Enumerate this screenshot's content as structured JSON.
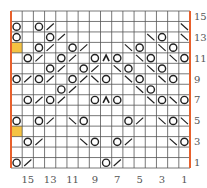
{
  "chart": {
    "columns": 16,
    "rows": 15,
    "colors": {
      "grid": "#555555",
      "border": "#e8602c",
      "highlight": "#f5c242",
      "symbol": "#222222",
      "label": "#555555"
    },
    "column_labels": [
      {
        "col": 15,
        "text": "15"
      },
      {
        "col": 13,
        "text": "13"
      },
      {
        "col": 11,
        "text": "11"
      },
      {
        "col": 9,
        "text": "9"
      },
      {
        "col": 7,
        "text": "7"
      },
      {
        "col": 5,
        "text": "5"
      },
      {
        "col": 3,
        "text": "3"
      },
      {
        "col": 1,
        "text": "1"
      }
    ],
    "row_labels": [
      {
        "row": 15,
        "text": "15"
      },
      {
        "row": 13,
        "text": "13"
      },
      {
        "row": 11,
        "text": "11"
      },
      {
        "row": 9,
        "text": "9"
      },
      {
        "row": 7,
        "text": "7"
      },
      {
        "row": 5,
        "text": "5"
      },
      {
        "row": 3,
        "text": "3"
      },
      {
        "row": 1,
        "text": "1"
      }
    ],
    "legend_symbols": {
      "O": "yarn-over",
      "/": "k2tog",
      "\\": "ssk",
      "^": "centered-double-decrease",
      "Y": "highlighted-cell"
    },
    "cells": {
      "15": {},
      "14": {
        "16": "O",
        "14": "O",
        "13": "/",
        "1": "\\"
      },
      "13": {
        "16": "O",
        "13": "O",
        "12": "/",
        "4": "\\",
        "3": "O",
        "1": "\\"
      },
      "12": {
        "16": "Y",
        "14": "O",
        "13": "/",
        "11": "O",
        "10": "/",
        "6": "\\",
        "5": "O",
        "3": "\\",
        "2": "O"
      },
      "11": {
        "15": "O",
        "14": "/",
        "12": "O",
        "11": "/",
        "9": "O",
        "8": "^",
        "7": "O",
        "5": "\\",
        "4": "O",
        "2": "\\",
        "1": "O"
      },
      "10": {
        "13": "O",
        "12": "/",
        "10": "O",
        "9": "/",
        "7": "\\",
        "6": "O",
        "4": "\\",
        "3": "O"
      },
      "9": {
        "16": "O",
        "15": "/",
        "14": "O",
        "13": "/",
        "11": "O",
        "10": "/",
        "9": "\\",
        "8": "O",
        "6": "\\",
        "5": "O",
        "3": "\\",
        "2": "O"
      },
      "8": {
        "12": "O",
        "11": "/",
        "5": "\\",
        "4": "O"
      },
      "7": {
        "15": "O",
        "14": "/",
        "13": "O",
        "12": "/",
        "9": "O",
        "8": "^",
        "7": "O",
        "4": "\\",
        "3": "O",
        "2": "\\",
        "1": "O"
      },
      "6": {},
      "5": {
        "16": "O",
        "14": "O",
        "13": "/",
        "11": "\\",
        "10": "O",
        "6": "O",
        "5": "/",
        "3": "\\",
        "2": "O",
        "1": "\\"
      },
      "4": {
        "16": "Y"
      },
      "3": {
        "15": "O",
        "14": "/",
        "10": "\\",
        "9": "O",
        "7": "O",
        "6": "/",
        "2": "\\",
        "1": "O"
      },
      "2": {},
      "1": {
        "16": "O",
        "15": "/",
        "8": "O",
        "7": "/"
      }
    }
  }
}
